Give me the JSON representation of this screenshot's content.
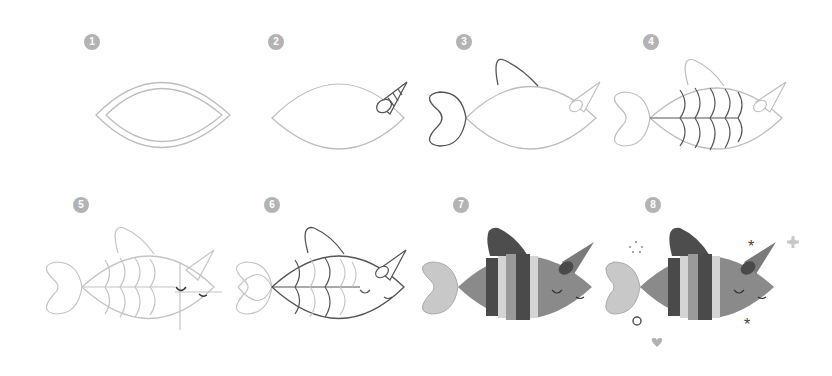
{
  "steps": [
    {
      "number": "1",
      "x": 84,
      "y": 34
    },
    {
      "number": "2",
      "x": 268,
      "y": 34
    },
    {
      "number": "3",
      "x": 456,
      "y": 34
    },
    {
      "number": "4",
      "x": 643,
      "y": 34
    },
    {
      "number": "5",
      "x": 73,
      "y": 197
    },
    {
      "number": "6",
      "x": 264,
      "y": 197
    },
    {
      "number": "7",
      "x": 453,
      "y": 197
    },
    {
      "number": "8",
      "x": 645,
      "y": 197
    }
  ],
  "colors": {
    "sketch_light": "#bdbdbd",
    "sketch_dark": "#555555",
    "body": "#8a8a8a",
    "scale_dark": "#4a4a4a",
    "scale_light": "#d4d4d4",
    "fin": "#4d4d4d",
    "tail": "#c8c8c8",
    "badge": "#b3b3b3"
  }
}
